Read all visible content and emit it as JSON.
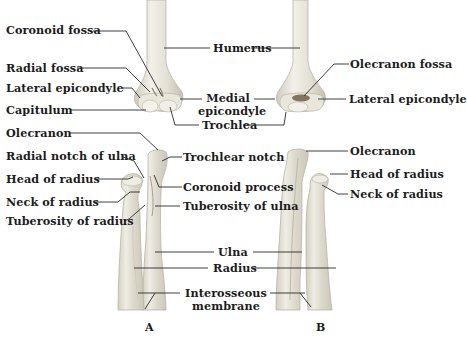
{
  "figure": {
    "panels": [
      {
        "id": "A",
        "label": "A"
      },
      {
        "id": "B",
        "label": "B"
      }
    ],
    "colors": {
      "bone_fill": "#e6e3d8",
      "bone_shade": "#c9c5b6",
      "bone_highlight": "#f4f2ea",
      "leader_line": "#2a2a2a",
      "text": "#1c1c1c",
      "fossa_dark": "#6e5f4a"
    },
    "labels_left": {
      "coronoid_fossa": "Coronoid fossa",
      "radial_fossa": "Radial fossa",
      "lateral_epicondyle": "Lateral epicondyle",
      "capitulum": "Capitulum",
      "olecranon": "Olecranon",
      "radial_notch": "Radial notch of ulna",
      "head_of_radius": "Head of radius",
      "neck_of_radius": "Neck of radius",
      "tuberosity_of_radius": "Tuberosity of radius"
    },
    "labels_center": {
      "humerus": "Humerus",
      "medial_epicondyle_1": "Medial",
      "medial_epicondyle_2": "epicondyle",
      "trochlea": "Trochlea",
      "trochlear_notch": "Trochlear notch",
      "coronoid_process": "Coronoid process",
      "tuberosity_of_ulna": "Tuberosity of ulna",
      "ulna": "Ulna",
      "radius": "Radius",
      "interosseous_1": "Interosseous",
      "interosseous_2": "membrane"
    },
    "labels_right": {
      "olecranon_fossa": "Olecranon fossa",
      "lateral_epicondyle": "Lateral epicondyle",
      "olecranon": "Olecranon",
      "head_of_radius": "Head of radius",
      "neck_of_radius": "Neck of radius"
    }
  }
}
